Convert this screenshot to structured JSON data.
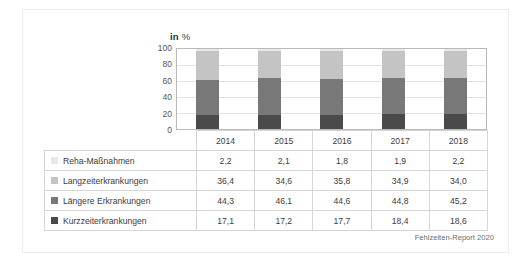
{
  "figure": {
    "chart_title_bold": "in",
    "chart_title_rest": "%",
    "source_note": "Fehlzeiten-Report 2020"
  },
  "chart_data": {
    "type": "bar",
    "subtype": "stacked-column",
    "title": "in %",
    "xlabel": "",
    "ylabel": "in %",
    "ylim": [
      0,
      100
    ],
    "yticks": [
      0,
      20,
      40,
      60,
      80,
      100
    ],
    "grid": true,
    "legend_position": "table-below",
    "categories": [
      "2014",
      "2015",
      "2016",
      "2017",
      "2018"
    ],
    "stack_order_bottom_to_top": [
      "Kurzzeiterkrankungen",
      "Längere Erkrankungen",
      "Langzeiterkrankungen",
      "Reha-Maßnahmen"
    ],
    "series": [
      {
        "name": "Reha-Maßnahmen",
        "color": "#e8e8e8",
        "values": [
          2.2,
          2.1,
          1.8,
          1.9,
          2.2
        ],
        "labels": [
          "2,2",
          "2,1",
          "1,8",
          "1,9",
          "2,2"
        ]
      },
      {
        "name": "Langzeiterkrankungen",
        "color": "#c4c4c4",
        "values": [
          36.4,
          34.6,
          35.8,
          34.9,
          34.0
        ],
        "labels": [
          "36,4",
          "34,6",
          "35,8",
          "34,9",
          "34,0"
        ]
      },
      {
        "name": "Längere Erkrankungen",
        "color": "#787878",
        "values": [
          44.3,
          46.1,
          44.6,
          44.8,
          45.2
        ],
        "labels": [
          "44,3",
          "46,1",
          "44,6",
          "44,8",
          "45,2"
        ]
      },
      {
        "name": "Kurzzeiterkrankungen",
        "color": "#4a4a4a",
        "values": [
          17.1,
          17.2,
          17.7,
          18.4,
          18.6
        ],
        "labels": [
          "17,1",
          "17,2",
          "17,7",
          "18,4",
          "18,6"
        ]
      }
    ]
  },
  "table": {
    "corner_label": "",
    "column_headers": [
      "2014",
      "2015",
      "2016",
      "2017",
      "2018"
    ],
    "rows": [
      {
        "label": "Reha-Maßnahmen",
        "swatch_color": "#e8e8e8",
        "values": [
          "2,2",
          "2,1",
          "1,8",
          "1,9",
          "2,2"
        ]
      },
      {
        "label": "Langzeiterkrankungen",
        "swatch_color": "#c4c4c4",
        "values": [
          "36,4",
          "34,6",
          "35,8",
          "34,9",
          "34,0"
        ]
      },
      {
        "label": "Längere Erkrankungen",
        "swatch_color": "#787878",
        "values": [
          "44,3",
          "46,1",
          "44,6",
          "44,8",
          "45,2"
        ]
      },
      {
        "label": "Kurzzeiterkrankungen",
        "swatch_color": "#4a4a4a",
        "values": [
          "17,1",
          "17,2",
          "17,7",
          "18,4",
          "18,6"
        ]
      }
    ]
  }
}
